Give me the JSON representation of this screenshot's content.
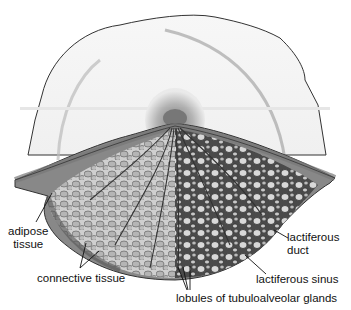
{
  "diagram": {
    "labels": [
      {
        "id": "adipose",
        "text_line1": "adipose",
        "text_line2": "tissue"
      },
      {
        "id": "connective",
        "text": "connective tissue"
      },
      {
        "id": "duct",
        "text_line1": "lactiferous",
        "text_line2": "duct"
      },
      {
        "id": "sinus",
        "text": "lactiferous sinus"
      },
      {
        "id": "lobules",
        "text": "lobules of tubuloalveolar glands"
      }
    ]
  }
}
